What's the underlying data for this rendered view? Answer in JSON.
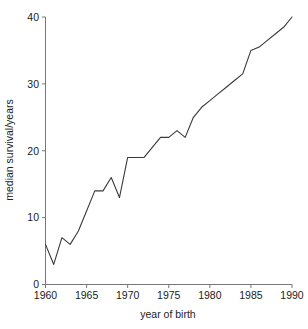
{
  "chart_data": {
    "type": "line",
    "title": "",
    "xlabel": "year of birth",
    "ylabel": "median survival/years",
    "xlim": [
      1960,
      1990
    ],
    "ylim": [
      0,
      40
    ],
    "xticks": [
      1960,
      1965,
      1970,
      1975,
      1980,
      1985,
      1990
    ],
    "xtick_labels": [
      "1960",
      "1965",
      "1970",
      "1975",
      "1980",
      "1985",
      "1990"
    ],
    "yticks": [
      0,
      10,
      20,
      30,
      40
    ],
    "ytick_labels": [
      "0",
      "10",
      "20",
      "30",
      "40"
    ],
    "grid": false,
    "legend": false,
    "legend_position": "none",
    "line_color": "#3a3a3a",
    "axis_color": "#777777",
    "background_color": "#ffffff",
    "x": [
      1960,
      1961,
      1962,
      1963,
      1964,
      1965,
      1966,
      1967,
      1968,
      1969,
      1970,
      1971,
      1972,
      1973,
      1974,
      1975,
      1976,
      1977,
      1978,
      1979,
      1980,
      1981,
      1982,
      1983,
      1984,
      1985,
      1986,
      1987,
      1988,
      1989,
      1990
    ],
    "values": [
      6.0,
      3.0,
      7.0,
      6.0,
      8.0,
      11.0,
      14.0,
      14.0,
      16.0,
      13.0,
      19.0,
      19.0,
      19.0,
      20.5,
      22.0,
      22.0,
      23.0,
      22.0,
      25.0,
      26.5,
      27.5,
      28.5,
      29.5,
      30.5,
      31.5,
      35.0,
      35.5,
      36.5,
      37.5,
      38.5,
      40.0
    ],
    "series": [
      {
        "name": "median survival",
        "values": [
          6.0,
          3.0,
          7.0,
          6.0,
          8.0,
          11.0,
          14.0,
          14.0,
          16.0,
          13.0,
          19.0,
          19.0,
          19.0,
          20.5,
          22.0,
          22.0,
          23.0,
          22.0,
          25.0,
          26.5,
          27.5,
          28.5,
          29.5,
          30.5,
          31.5,
          35.0,
          35.5,
          36.5,
          37.5,
          38.5,
          40.0
        ]
      }
    ]
  },
  "figure": {
    "name": "median-survival-vs-year-of-birth"
  }
}
